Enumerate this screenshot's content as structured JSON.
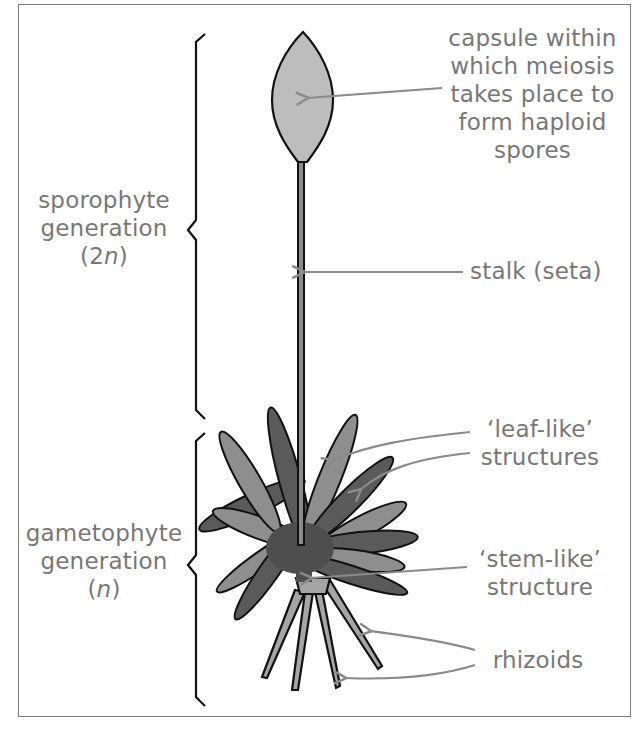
{
  "diagram": {
    "colors": {
      "label_text": "#777777",
      "arrow": "#8a8a8a",
      "outline": "#111111",
      "capsule_fill": "#bdbdbd",
      "leaf_light": "#8e8e8e",
      "leaf_dark": "#5a5a5a",
      "rhizoid_fill": "#a5a5a5",
      "frame": "#7a7a7a"
    },
    "generations": [
      {
        "id": "sporophyte",
        "line1": "sporophyte",
        "line2": "generation",
        "ploidy_open": "(2",
        "ploidy_var": "n",
        "ploidy_close": ")"
      },
      {
        "id": "gametophyte",
        "line1": "gametophyte",
        "line2": "generation",
        "ploidy_open": "(",
        "ploidy_var": "n",
        "ploidy_close": ")"
      }
    ],
    "labels": {
      "capsule": [
        "capsule within",
        "which meiosis",
        "takes place to",
        "form haploid",
        "spores"
      ],
      "stalk": "stalk (seta)",
      "leaf_like": [
        "‘leaf-like’",
        "structures"
      ],
      "stem_like": [
        "‘stem-like’",
        "structure"
      ],
      "rhizoids": "rhizoids"
    }
  }
}
